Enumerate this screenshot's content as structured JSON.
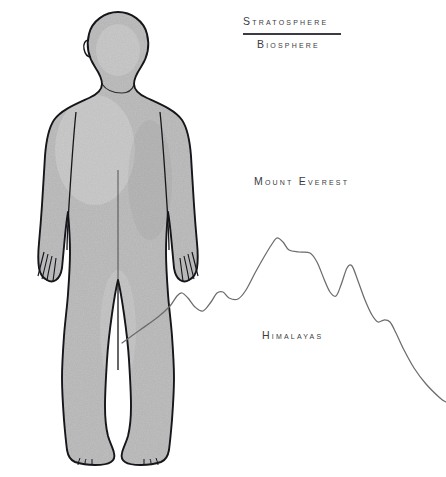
{
  "figure": {
    "orientation": "standing-front-view",
    "fill_color": "#a8a8a8",
    "outline_color": "#1a1a1a",
    "background_color": "#ffffff"
  },
  "labels": {
    "stratosphere": "Stratosphere",
    "biosphere": "Biosphere",
    "mount_everest": "Mount Everest",
    "himalayas": "Himalayas"
  },
  "divider": {
    "name": "stratosphere-biosphere-boundary",
    "color": "#3b3b42"
  },
  "chart_data": {
    "type": "line",
    "xlabel": "",
    "ylabel": "",
    "grid": false,
    "legend_position": "none",
    "annotations": [
      {
        "text": "Stratosphere",
        "x": 243,
        "y": 15
      },
      {
        "text": "Biosphere",
        "x": 257,
        "y": 38
      },
      {
        "text": "Mount Everest",
        "x": 254,
        "y": 175
      },
      {
        "text": "Himalayas",
        "x": 262,
        "y": 329
      }
    ],
    "series": [
      {
        "name": "Himalaya ridge profile",
        "stroke": "#6b6b70",
        "points": [
          [
            122,
            343
          ],
          [
            140,
            330
          ],
          [
            158,
            317
          ],
          [
            170,
            306
          ],
          [
            177,
            296
          ],
          [
            182,
            293
          ],
          [
            188,
            298
          ],
          [
            195,
            307
          ],
          [
            203,
            311
          ],
          [
            211,
            302
          ],
          [
            217,
            293
          ],
          [
            223,
            292
          ],
          [
            229,
            298
          ],
          [
            238,
            299
          ],
          [
            246,
            290
          ],
          [
            255,
            273
          ],
          [
            264,
            257
          ],
          [
            272,
            244
          ],
          [
            277,
            238
          ],
          [
            283,
            242
          ],
          [
            289,
            250
          ],
          [
            299,
            252
          ],
          [
            310,
            253
          ],
          [
            317,
            262
          ],
          [
            324,
            279
          ],
          [
            330,
            292
          ],
          [
            336,
            296
          ],
          [
            341,
            285
          ],
          [
            347,
            268
          ],
          [
            352,
            266
          ],
          [
            358,
            281
          ],
          [
            365,
            300
          ],
          [
            372,
            315
          ],
          [
            378,
            322
          ],
          [
            384,
            320
          ],
          [
            390,
            322
          ],
          [
            396,
            333
          ],
          [
            404,
            350
          ],
          [
            414,
            368
          ],
          [
            426,
            384
          ],
          [
            440,
            398
          ],
          [
            446,
            402
          ]
        ]
      }
    ]
  }
}
